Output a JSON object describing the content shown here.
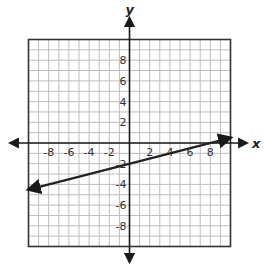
{
  "chart_data": {
    "type": "line",
    "title": "",
    "xlabel": "x",
    "ylabel": "y",
    "xlim": [
      -10,
      10
    ],
    "ylim": [
      -10,
      10
    ],
    "grid": true,
    "grid_step": 1,
    "x_tick_labels": [
      "-8",
      "-6",
      "-4",
      "-2",
      "2",
      "4",
      "6",
      "8"
    ],
    "y_tick_labels": [
      "8",
      "6",
      "4",
      "2",
      "-2",
      "-4",
      "-6",
      "-8"
    ],
    "series": [
      {
        "name": "line",
        "equation": "y = 0.25x - 2",
        "slope": 0.25,
        "y_intercept": -2,
        "x": [
          -10,
          10
        ],
        "y": [
          -4.5,
          0.5
        ],
        "arrows_both_ends": true,
        "color": "#222222"
      }
    ]
  },
  "colors": {
    "grid": "#bdbdbd",
    "frame": "#333333",
    "axis": "#1a1a1a",
    "line": "#222222"
  }
}
